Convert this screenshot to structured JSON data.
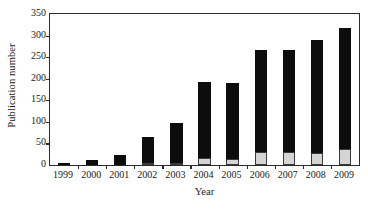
{
  "chart_data": {
    "type": "bar",
    "subtype": "stacked-bar",
    "title": "",
    "xlabel": "Year",
    "ylabel": "Publication number",
    "categories": [
      "1999",
      "2000",
      "2001",
      "2002",
      "2003",
      "2004",
      "2005",
      "2006",
      "2007",
      "2008",
      "2009"
    ],
    "series": [
      {
        "name": "lower-segment",
        "color": "#d4d4d4",
        "values": [
          0,
          0,
          0,
          1,
          5,
          16,
          13,
          30,
          30,
          29,
          36
        ]
      },
      {
        "name": "upper-segment",
        "color": "#0d0d0d",
        "values": [
          2,
          12,
          24,
          60,
          93,
          177,
          176,
          236,
          237,
          261,
          282
        ]
      }
    ],
    "totals": [
      2,
      12,
      24,
      61,
      98,
      193,
      189,
      266,
      267,
      290,
      318
    ],
    "ylim": [
      0,
      350
    ],
    "ytick_values": [
      0,
      50,
      100,
      150,
      200,
      250,
      300,
      350
    ],
    "ytick_labels": [
      "0",
      "50",
      "100",
      "150",
      "200",
      "250",
      "300",
      "350"
    ],
    "grid": false,
    "legend": "none",
    "frame": "box"
  },
  "axes": {
    "y_title": "Publication number",
    "x_title": "Year"
  }
}
